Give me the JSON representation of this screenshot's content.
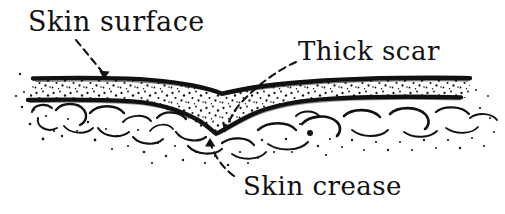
{
  "figure": {
    "type": "line-drawing",
    "width": 505,
    "height": 214,
    "background_color": "#ffffff",
    "ink_color": "#111111"
  },
  "labels": {
    "skin_surface": "Skin surface",
    "thick_scar": "Thick scar",
    "skin_crease": "Skin crease"
  },
  "annotations": [
    {
      "name": "skin-surface-leader",
      "label": "Skin surface",
      "style": "dashed-arrow",
      "from": [
        78,
        40
      ],
      "to": [
        105,
        79
      ],
      "points_at": "epidermis-surface-line"
    },
    {
      "name": "thick-scar-leader",
      "label": "Thick scar",
      "style": "dashed-curved-arrow",
      "from": [
        296,
        60
      ],
      "to": [
        224,
        131
      ],
      "points_at": "thickened-dermis-base"
    },
    {
      "name": "skin-crease-leader",
      "label": "Skin crease",
      "style": "dashed-curved-arrow",
      "from": [
        232,
        178
      ],
      "to": [
        211,
        139
      ],
      "points_at": "crease-apex"
    }
  ],
  "anatomy": {
    "layers": [
      {
        "name": "skin-surface-line",
        "description": "Outer epidermal contour, dipping into a V-shaped crease at centre",
        "stroke_width": 4
      },
      {
        "name": "dermis-band",
        "description": "Stippled band between surface line and deep boundary; greatly thickened beneath the crease to represent the scar",
        "fill": "stipple"
      },
      {
        "name": "dermis-base-line",
        "description": "Deep boundary of dermis / scar, plunging downward under the crease",
        "stroke_width": 4
      },
      {
        "name": "subcutaneous-fat",
        "description": "Fat lobules drawn as open crescent arcs with sparse stipple dots",
        "fill": "arcs-and-dots"
      }
    ],
    "crease": {
      "apex_x": 222,
      "surface_apex_y": 93,
      "scar_base_y": 135
    }
  }
}
